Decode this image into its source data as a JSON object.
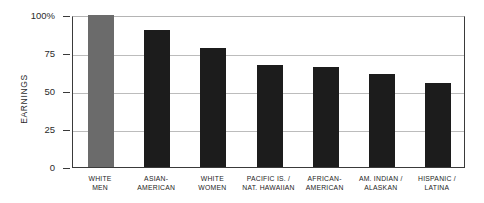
{
  "chart_data": {
    "type": "bar",
    "title": "",
    "xlabel": "",
    "ylabel": "EARNINGS",
    "ylim": [
      0,
      100
    ],
    "grid": true,
    "legend": "none",
    "y_ticks": [
      {
        "value": 100,
        "label": "100%"
      },
      {
        "value": 75,
        "label": "75"
      },
      {
        "value": 50,
        "label": "50"
      },
      {
        "value": 25,
        "label": "25"
      },
      {
        "value": 0,
        "label": "0"
      }
    ],
    "categories": [
      "WHITE MEN",
      "ASIAN-AMERICAN",
      "WHITE WOMEN",
      "PACIFIC IS. / NAT. HAWAIIAN",
      "AFRICAN-AMERICAN",
      "AM. INDIAN / ALASKAN",
      "HISPANIC / LATINA"
    ],
    "category_lines": [
      [
        "WHITE",
        "MEN"
      ],
      [
        "ASIAN-",
        "AMERICAN"
      ],
      [
        "WHITE",
        "WOMEN"
      ],
      [
        "PACIFIC IS. /",
        "NAT. HAWAIIAN"
      ],
      [
        "AFRICAN-",
        "AMERICAN"
      ],
      [
        "AM. INDIAN /",
        "ALASKAN"
      ],
      [
        "HISPANIC /",
        "LATINA"
      ]
    ],
    "values": [
      100,
      90,
      78,
      67,
      66,
      61,
      55
    ],
    "bar_colors": [
      "#6b6b6b",
      "#1c1c1c",
      "#1c1c1c",
      "#1c1c1c",
      "#1c1c1c",
      "#1c1c1c",
      "#1c1c1c"
    ]
  },
  "colors": {
    "highlight_bar": "#6b6b6b",
    "bar": "#1c1c1c",
    "gridline": "#bcbcbc",
    "axis": "#3a3a3a",
    "text": "#232323",
    "background": "#ffffff"
  }
}
